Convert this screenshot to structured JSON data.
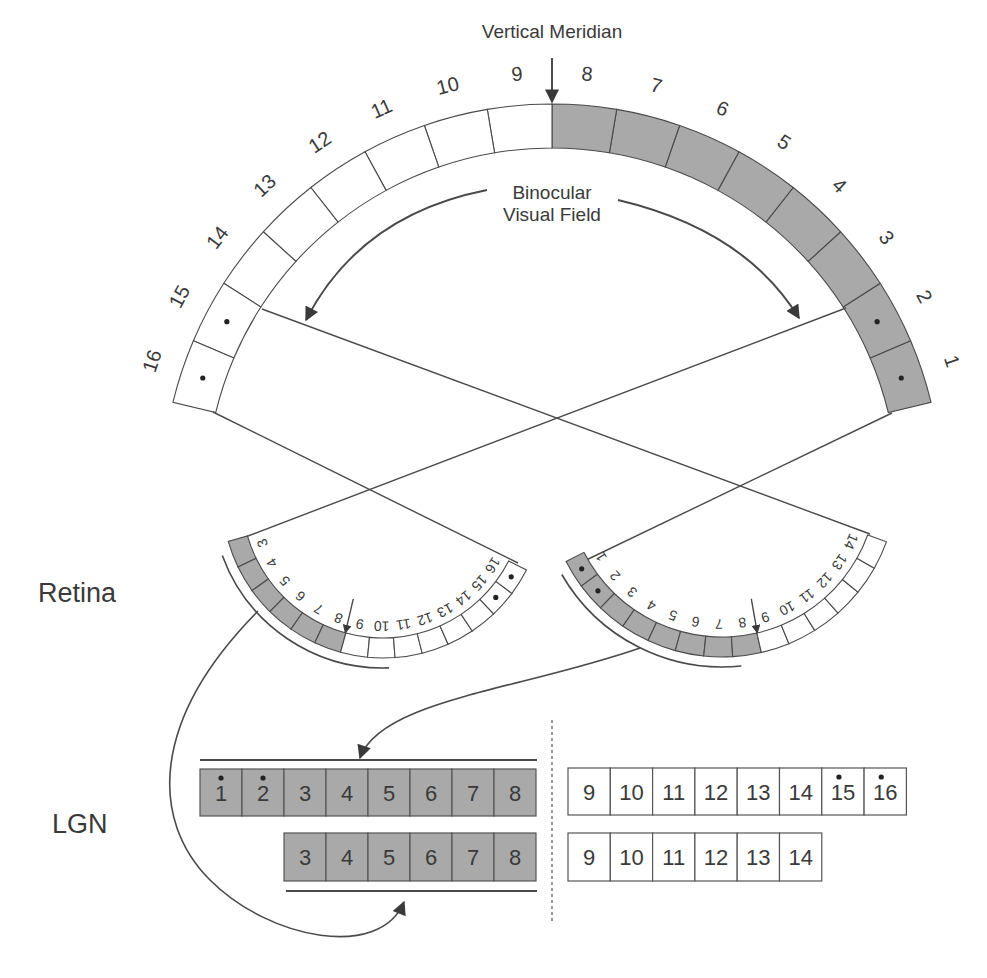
{
  "labels": {
    "vertical_meridian": "Vertical Meridian",
    "binocular_line1": "Binocular",
    "binocular_line2": "Visual Field",
    "retina": "Retina",
    "lgn": "LGN"
  },
  "colors": {
    "shaded": "#a9a9a9",
    "line": "#4a4a4a",
    "text": "#3a3a3a",
    "white": "#ffffff"
  },
  "visual_field": {
    "cells": [
      "1",
      "2",
      "3",
      "4",
      "5",
      "6",
      "7",
      "8",
      "9",
      "10",
      "11",
      "12",
      "13",
      "14",
      "15",
      "16"
    ],
    "shaded": [
      "1",
      "2",
      "3",
      "4",
      "5",
      "6",
      "7",
      "8"
    ],
    "dotted": [
      "1",
      "2",
      "15",
      "16"
    ]
  },
  "retina_left": {
    "cells": [
      "3",
      "4",
      "5",
      "6",
      "7",
      "8",
      "9",
      "10",
      "11",
      "12",
      "13",
      "14",
      "15",
      "16"
    ],
    "shaded": [
      "3",
      "4",
      "5",
      "6",
      "7",
      "8"
    ],
    "dotted": [
      "15",
      "16"
    ],
    "fovea_between": [
      "8",
      "9"
    ]
  },
  "retina_right": {
    "cells": [
      "1",
      "2",
      "3",
      "4",
      "5",
      "6",
      "7",
      "8",
      "9",
      "10",
      "11",
      "12",
      "13",
      "14"
    ],
    "shaded": [
      "1",
      "2",
      "3",
      "4",
      "5",
      "6",
      "7",
      "8"
    ],
    "dotted": [
      "1",
      "2"
    ],
    "fovea_between": [
      "8",
      "9"
    ]
  },
  "lgn": {
    "left_top": [
      "1",
      "2",
      "3",
      "4",
      "5",
      "6",
      "7",
      "8"
    ],
    "left_top_dotted": [
      "1",
      "2"
    ],
    "left_bottom": [
      "3",
      "4",
      "5",
      "6",
      "7",
      "8"
    ],
    "right_top": [
      "9",
      "10",
      "11",
      "12",
      "13",
      "14",
      "15",
      "16"
    ],
    "right_top_dotted": [
      "15",
      "16"
    ],
    "right_bottom": [
      "9",
      "10",
      "11",
      "12",
      "13",
      "14"
    ]
  }
}
